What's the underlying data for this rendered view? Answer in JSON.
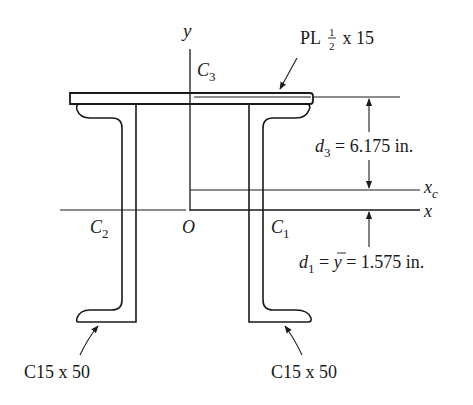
{
  "diagram": {
    "type": "built-up section cross-section",
    "colors": {
      "stroke": "#1a1a1a",
      "background": "#ffffff"
    },
    "axes": {
      "y_label": "y",
      "x_label": "x",
      "xc_label": "x",
      "xc_sub": "c",
      "origin_label": "O"
    },
    "centroids": {
      "c1": {
        "main": "C",
        "sub": "1"
      },
      "c2": {
        "main": "C",
        "sub": "2"
      },
      "c3": {
        "main": "C",
        "sub": "3"
      }
    },
    "plate_label": {
      "prefix": "PL",
      "frac_num": "1",
      "frac_den": "2",
      "suffix": " x 15"
    },
    "channel_labels": {
      "left": "C15 x 50",
      "right": "C15 x 50"
    },
    "dimensions": {
      "d3": {
        "var": "d",
        "sub": "3",
        "text": " = 6.175 in."
      },
      "d1": {
        "var": "d",
        "sub": "1",
        "mid": " = ",
        "ybar": "y",
        "text": " = 1.575 in."
      }
    }
  }
}
